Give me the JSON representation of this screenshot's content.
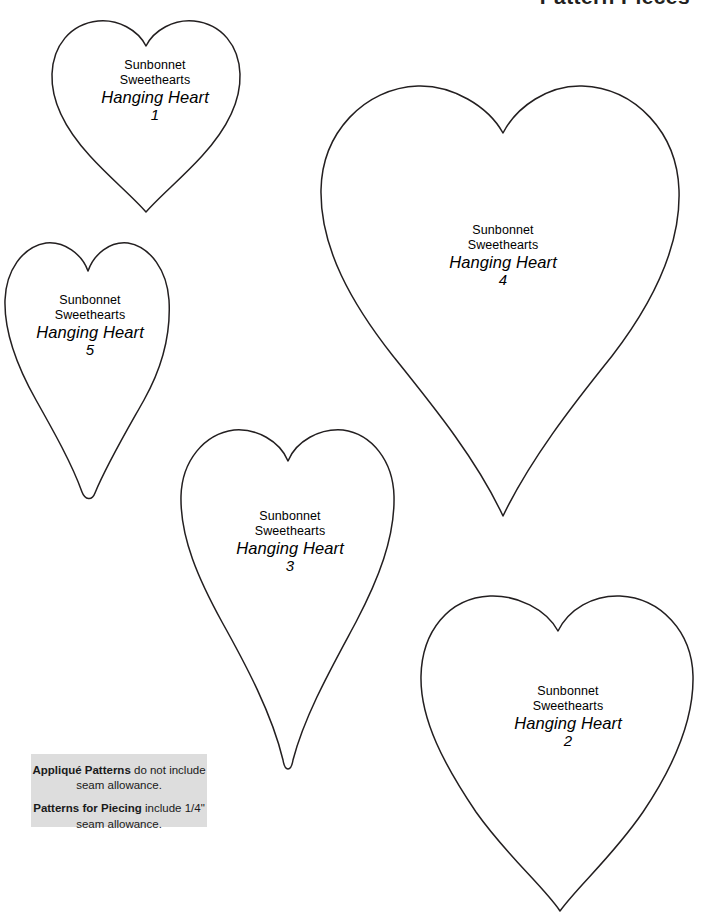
{
  "page": {
    "header_title": "Pattern Pieces",
    "background_color": "#ffffff",
    "ink_color": "#231f20",
    "width": 714,
    "height": 919
  },
  "common": {
    "brand_line_1": "Sunbonnet",
    "brand_line_2": "Sweethearts",
    "piece_name": "Hanging Heart"
  },
  "pieces": [
    {
      "id": "heart-1",
      "number": "1",
      "brand_line_1": "Sunbonnet",
      "brand_line_2": "Sweethearts",
      "piece_name": "Hanging Heart"
    },
    {
      "id": "heart-2",
      "number": "2",
      "brand_line_1": "Sunbonnet",
      "brand_line_2": "Sweethearts",
      "piece_name": "Hanging Heart"
    },
    {
      "id": "heart-3",
      "number": "3",
      "brand_line_1": "Sunbonnet",
      "brand_line_2": "Sweethearts",
      "piece_name": "Hanging Heart"
    },
    {
      "id": "heart-4",
      "number": "4",
      "brand_line_1": "Sunbonnet",
      "brand_line_2": "Sweethearts",
      "piece_name": "Hanging Heart"
    },
    {
      "id": "heart-5",
      "number": "5",
      "brand_line_1": "Sunbonnet",
      "brand_line_2": "Sweethearts",
      "piece_name": "Hanging Heart"
    }
  ],
  "note_box": {
    "background_color": "#dddddd",
    "line_1_bold": "Appliqué Patterns",
    "line_1_rest": " do not include seam allowance.",
    "line_2_bold": "Patterns for Piecing",
    "line_2_rest": " include 1/4\" seam allowance."
  }
}
